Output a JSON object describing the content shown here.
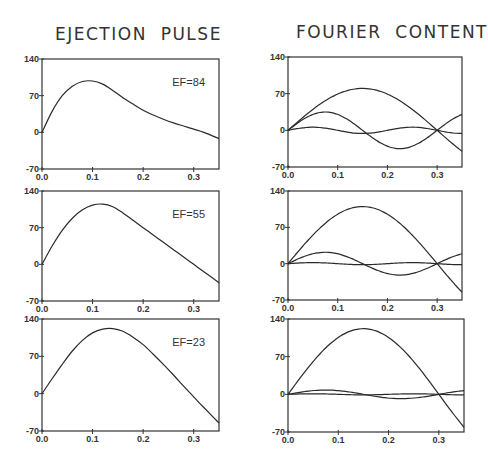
{
  "titles": {
    "left": "EJECTION  PULSE",
    "right": "FOURIER  CONTENT"
  },
  "axes": {
    "x_ticks": [
      "0.0",
      "0.1",
      "0.2",
      "0.3"
    ],
    "x_tick_values": [
      0.0,
      0.1,
      0.2,
      0.3
    ],
    "y_ticks": [
      "-70",
      "0",
      "70",
      "140"
    ],
    "y_tick_values": [
      -70,
      0,
      70,
      140
    ],
    "xlim": [
      0,
      0.35
    ],
    "ylim": [
      -70,
      140
    ]
  },
  "chart_data": [
    {
      "type": "line",
      "panel": "left-1",
      "title": "EJECTION PULSE",
      "annotation": "EF=84",
      "xlim": [
        0,
        0.35
      ],
      "ylim": [
        -70,
        140
      ],
      "series": [
        {
          "name": "pulse",
          "x": [
            0,
            0.02,
            0.04,
            0.06,
            0.08,
            0.1,
            0.12,
            0.14,
            0.16,
            0.18,
            0.2,
            0.22,
            0.24,
            0.26,
            0.28,
            0.3,
            0.32,
            0.35
          ],
          "values": [
            0,
            40,
            70,
            88,
            97,
            98,
            92,
            80,
            66,
            54,
            42,
            33,
            25,
            18,
            12,
            6,
            0,
            -12
          ]
        }
      ]
    },
    {
      "type": "line",
      "panel": "left-2",
      "annotation": "EF=55",
      "xlim": [
        0,
        0.35
      ],
      "ylim": [
        -70,
        140
      ],
      "series": [
        {
          "name": "pulse",
          "x": [
            0,
            0.02,
            0.04,
            0.06,
            0.08,
            0.1,
            0.12,
            0.14,
            0.16,
            0.18,
            0.2,
            0.22,
            0.24,
            0.26,
            0.28,
            0.3,
            0.32,
            0.35
          ],
          "values": [
            0,
            35,
            65,
            88,
            104,
            113,
            115,
            110,
            98,
            84,
            70,
            56,
            42,
            28,
            14,
            0,
            -14,
            -35
          ]
        }
      ]
    },
    {
      "type": "line",
      "panel": "left-3",
      "annotation": "EF=23",
      "xlim": [
        0,
        0.35
      ],
      "ylim": [
        -70,
        140
      ],
      "series": [
        {
          "name": "pulse",
          "x": [
            0,
            0.02,
            0.04,
            0.06,
            0.08,
            0.1,
            0.12,
            0.14,
            0.16,
            0.18,
            0.2,
            0.22,
            0.24,
            0.26,
            0.28,
            0.3,
            0.32,
            0.35
          ],
          "values": [
            0,
            28,
            55,
            80,
            100,
            114,
            121,
            122,
            117,
            106,
            92,
            74,
            55,
            35,
            14,
            -6,
            -26,
            -55
          ]
        }
      ]
    },
    {
      "type": "line",
      "panel": "right-1",
      "title": "FOURIER CONTENT",
      "xlim": [
        0,
        0.35
      ],
      "ylim": [
        -70,
        140
      ],
      "period": 0.6,
      "series": [
        {
          "name": "harmonic-1",
          "amplitude": 80,
          "harmonic": 1
        },
        {
          "name": "harmonic-2",
          "amplitude": 35,
          "harmonic": 2
        },
        {
          "name": "harmonic-3",
          "amplitude": 6,
          "harmonic": 3
        }
      ]
    },
    {
      "type": "line",
      "panel": "right-2",
      "xlim": [
        0,
        0.35
      ],
      "ylim": [
        -70,
        140
      ],
      "period": 0.6,
      "series": [
        {
          "name": "harmonic-1",
          "amplitude": 110,
          "harmonic": 1
        },
        {
          "name": "harmonic-2",
          "amplitude": 22,
          "harmonic": 2
        },
        {
          "name": "harmonic-3",
          "amplitude": 2,
          "harmonic": 3
        }
      ]
    },
    {
      "type": "line",
      "panel": "right-3",
      "xlim": [
        0,
        0.35
      ],
      "ylim": [
        -70,
        140
      ],
      "period": 0.6,
      "series": [
        {
          "name": "harmonic-1",
          "amplitude": 122,
          "harmonic": 1
        },
        {
          "name": "harmonic-2",
          "amplitude": 8,
          "harmonic": 2
        },
        {
          "name": "harmonic-3",
          "amplitude": 1,
          "harmonic": 3
        }
      ]
    }
  ],
  "panels": [
    {
      "id": "left-1",
      "x": 42,
      "y": 59,
      "w": 177,
      "h": 110,
      "ef_label": "EF=84"
    },
    {
      "id": "left-2",
      "x": 42,
      "y": 191,
      "w": 177,
      "h": 110,
      "ef_label": "EF=55"
    },
    {
      "id": "left-3",
      "x": 42,
      "y": 319,
      "w": 177,
      "h": 112,
      "ef_label": "EF=23"
    },
    {
      "id": "right-1",
      "x": 288,
      "y": 57,
      "w": 174,
      "h": 110
    },
    {
      "id": "right-2",
      "x": 288,
      "y": 191,
      "w": 174,
      "h": 109
    },
    {
      "id": "right-3",
      "x": 288,
      "y": 319,
      "w": 176,
      "h": 113
    }
  ],
  "colors": {
    "line": "#2a2a2a",
    "frame": "#333333",
    "text": "#333333"
  }
}
